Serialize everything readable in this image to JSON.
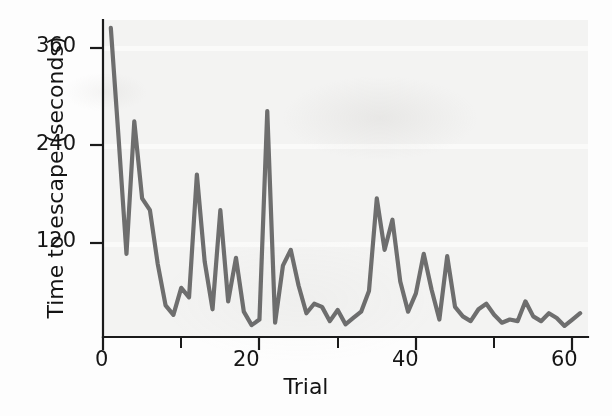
{
  "chart_data": {
    "type": "line",
    "title": "",
    "xlabel": "Trial",
    "ylabel": "Time to escape (seconds)",
    "xlim": [
      0,
      62
    ],
    "ylim": [
      0,
      400
    ],
    "xticks": [
      0,
      20,
      40,
      60
    ],
    "xtick_labels": [
      "0",
      "20",
      "40",
      "60"
    ],
    "yticks": [
      120,
      240,
      360
    ],
    "ytick_labels": [
      "120",
      "240",
      "360"
    ],
    "grid": false,
    "legend": "none",
    "line_color": "#6e6e6e",
    "axis_color": "#1a1a1a",
    "background_color": "#f3f3f2",
    "series": [
      {
        "name": "Time to escape",
        "x": [
          1,
          2,
          3,
          4,
          5,
          6,
          7,
          8,
          9,
          10,
          11,
          12,
          13,
          14,
          15,
          16,
          17,
          18,
          19,
          20,
          21,
          22,
          23,
          24,
          25,
          26,
          27,
          28,
          29,
          30,
          31,
          32,
          33,
          34,
          35,
          36,
          37,
          38,
          39,
          40,
          41,
          42,
          43,
          44,
          45,
          46,
          47,
          48,
          49,
          50,
          51,
          52,
          53,
          54,
          55,
          56,
          57,
          58,
          59,
          60,
          61
        ],
        "values": [
          390,
          250,
          105,
          272,
          175,
          160,
          92,
          40,
          28,
          62,
          50,
          205,
          95,
          35,
          160,
          45,
          100,
          32,
          15,
          22,
          285,
          18,
          90,
          110,
          65,
          30,
          42,
          38,
          20,
          34,
          16,
          24,
          32,
          58,
          175,
          110,
          148,
          70,
          32,
          55,
          105,
          60,
          22,
          102,
          38,
          26,
          20,
          35,
          42,
          28,
          18,
          22,
          20,
          45,
          26,
          20,
          30,
          24,
          14,
          22,
          30
        ]
      }
    ]
  },
  "axis": {
    "y_label": "Time to escape (seconds)",
    "x_label": "Trial",
    "y_ticks": [
      "360",
      "240",
      "120"
    ],
    "x_ticks": [
      "0",
      "20",
      "40",
      "60"
    ]
  }
}
